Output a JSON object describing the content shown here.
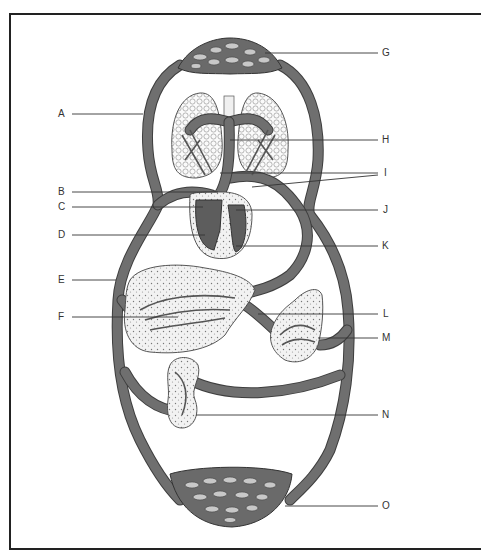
{
  "figure": {
    "labels_left": [
      {
        "id": "A",
        "text": "A",
        "x": 58,
        "y": 109,
        "line_x1": 72,
        "line_x2": 143
      },
      {
        "id": "B",
        "text": "B",
        "x": 58,
        "y": 187,
        "line_x1": 72,
        "line_x2": 218
      },
      {
        "id": "C",
        "text": "C",
        "x": 58,
        "y": 202,
        "line_x1": 72,
        "line_x2": 203
      },
      {
        "id": "D",
        "text": "D",
        "x": 58,
        "y": 230,
        "line_x1": 72,
        "line_x2": 205
      },
      {
        "id": "E",
        "text": "E",
        "x": 58,
        "y": 275,
        "line_x1": 72,
        "line_x2": 116
      },
      {
        "id": "F",
        "text": "F",
        "x": 58,
        "y": 312,
        "line_x1": 72,
        "line_x2": 178
      }
    ],
    "labels_right": [
      {
        "id": "G",
        "text": "G",
        "x": 382,
        "y": 48,
        "line_x1": 265,
        "line_x2": 378
      },
      {
        "id": "H",
        "text": "H",
        "x": 382,
        "y": 135,
        "line_x1": 230,
        "line_x2": 378
      },
      {
        "id": "I",
        "text": "I",
        "x": 384,
        "y": 168,
        "line_x1": 220,
        "line_x2": 378
      },
      {
        "id": "J",
        "text": "J",
        "x": 383,
        "y": 205,
        "line_x1": 236,
        "line_x2": 378
      },
      {
        "id": "K",
        "text": "K",
        "x": 382,
        "y": 241,
        "line_x1": 236,
        "line_x2": 378
      },
      {
        "id": "L",
        "text": "L",
        "x": 383,
        "y": 309,
        "line_x1": 258,
        "line_x2": 378
      },
      {
        "id": "M",
        "text": "M",
        "x": 382,
        "y": 333,
        "line_x1": 318,
        "line_x2": 378
      },
      {
        "id": "N",
        "text": "N",
        "x": 382,
        "y": 410,
        "line_x1": 196,
        "line_x2": 378
      },
      {
        "id": "O",
        "text": "O",
        "x": 382,
        "y": 501,
        "line_x1": 285,
        "line_x2": 378
      }
    ],
    "components": [
      "head-capillary-bed",
      "lungs",
      "trachea",
      "heart",
      "liver",
      "intestine",
      "kidney",
      "lower-body-capillary-bed",
      "main-vessel-loop"
    ],
    "colors": {
      "vessel": "#6f6f6f",
      "vessel_edge": "#3e3e3e",
      "line": "#333333",
      "background": "#ffffff",
      "frame": "#222222"
    }
  }
}
